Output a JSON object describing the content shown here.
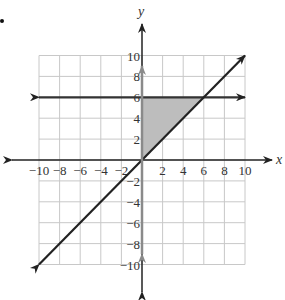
{
  "problem": {
    "bullet": "•"
  },
  "chart_data": {
    "type": "line",
    "title": "",
    "xlabel": "x",
    "ylabel": "y",
    "xlim": [
      -10,
      10
    ],
    "ylim": [
      -10,
      10
    ],
    "grid": true,
    "x_ticks": [
      -10,
      -8,
      -6,
      -4,
      -2,
      2,
      4,
      6,
      8,
      10
    ],
    "y_ticks": [
      10,
      8,
      6,
      4,
      2,
      -2,
      -4,
      -6,
      -8,
      -10
    ],
    "x_tick_labels": [
      "−10",
      "−8",
      "−6",
      "−4",
      "−2",
      "2",
      "4",
      "6",
      "8",
      "10"
    ],
    "y_tick_labels": [
      "10",
      "8",
      "6",
      "4",
      "2",
      "−2",
      "−4",
      "−6",
      "−8",
      "−10"
    ],
    "series": [
      {
        "name": "y = 6",
        "points": [
          [
            -10,
            6
          ],
          [
            10,
            6
          ]
        ],
        "color": "#333333",
        "arrows": "both"
      },
      {
        "name": "y = x",
        "points": [
          [
            -10,
            -10
          ],
          [
            10,
            10
          ]
        ],
        "color": "#222222",
        "arrows": "both"
      },
      {
        "name": "x = 0",
        "points": [
          [
            0,
            -9
          ],
          [
            0,
            9
          ]
        ],
        "color": "#8a8a8a",
        "arrows": "both"
      }
    ],
    "shaded_region": {
      "vertices": [
        [
          0,
          0
        ],
        [
          0,
          6
        ],
        [
          6,
          6
        ]
      ],
      "fill": "#bdbdbd"
    },
    "colors": {
      "grid": "#c8c8c8",
      "axis": "#222222",
      "gray_line": "#8a8a8a",
      "shade": "#bdbdbd"
    }
  }
}
